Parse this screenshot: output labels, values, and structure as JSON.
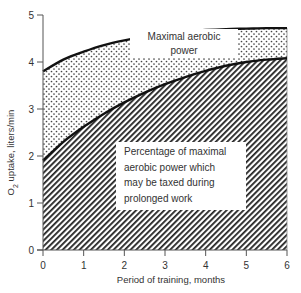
{
  "chart_data": {
    "type": "area",
    "title": "",
    "xlabel": "Period of training, months",
    "ylabel": "O2 uptake, liters/min",
    "ylabel_main": "O",
    "ylabel_sub": "2",
    "ylabel_rest": " uptake, liters/min",
    "x_ticks": [
      "0",
      "1",
      "2",
      "3",
      "4",
      "5",
      "6"
    ],
    "y_ticks": [
      "0",
      "1",
      "2",
      "3",
      "4",
      "5"
    ],
    "xlim": [
      0,
      6
    ],
    "ylim": [
      0,
      5
    ],
    "grid": false,
    "legend": "none (in-plot annotations)",
    "x": [
      0,
      0.5,
      1,
      1.5,
      2,
      2.5,
      3,
      3.5,
      4,
      4.5,
      5,
      5.5,
      6
    ],
    "series": [
      {
        "name": "Maximal aerobic power",
        "fill": "dotted",
        "values": [
          3.8,
          4.05,
          4.22,
          4.36,
          4.46,
          4.54,
          4.6,
          4.65,
          4.68,
          4.7,
          4.71,
          4.72,
          4.72
        ]
      },
      {
        "name": "Percentage of maximal aerobic power which may be taxed during prolonged work",
        "fill": "hatched",
        "values": [
          1.9,
          2.3,
          2.62,
          2.9,
          3.14,
          3.35,
          3.53,
          3.68,
          3.81,
          3.92,
          4.0,
          4.05,
          4.08
        ]
      }
    ],
    "annotations": [
      {
        "text": "Maximal aerobic power",
        "lines": [
          "Maximal aerobic",
          "power"
        ]
      },
      {
        "text": "Percentage of maximal aerobic power which may be taxed during prolonged work",
        "lines": [
          "Percentage of maximal",
          "aerobic power which",
          "may be taxed during",
          "prolonged work"
        ]
      }
    ]
  },
  "colors": {
    "line": "#111111",
    "hatch": "#222222",
    "dots": "#444444",
    "axis": "#555555"
  }
}
